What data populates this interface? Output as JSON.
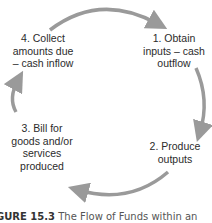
{
  "diagram": {
    "type": "cycle",
    "arrow_color": "#9a9a9a",
    "nodes": [
      {
        "id": "1",
        "lines": [
          "1. Obtain",
          "inputs – cash",
          "outflow"
        ]
      },
      {
        "id": "2",
        "lines": [
          "2. Produce",
          "outputs"
        ]
      },
      {
        "id": "3",
        "lines": [
          "3. Bill for",
          "goods and/or",
          "services",
          "produced"
        ]
      },
      {
        "id": "4",
        "lines": [
          "4. Collect",
          "amounts due",
          "– cash inflow"
        ]
      }
    ],
    "edges": [
      {
        "from": "4",
        "to": "1"
      },
      {
        "from": "1",
        "to": "2"
      },
      {
        "from": "2",
        "to": "3"
      },
      {
        "from": "3",
        "to": "4"
      }
    ]
  },
  "caption": {
    "label": "GURE 15.3",
    "text": "The Flow of Funds within an"
  }
}
